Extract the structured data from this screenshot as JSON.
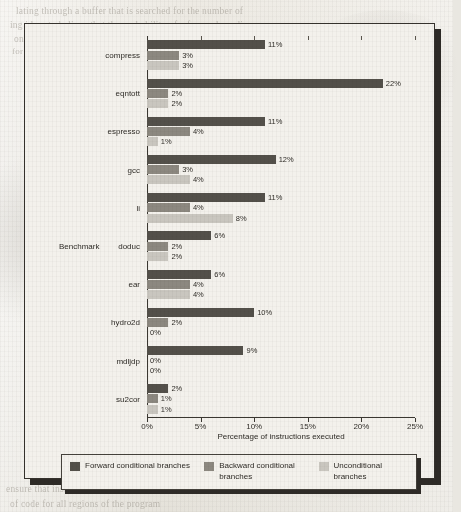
{
  "chart_data": {
    "type": "bar",
    "orientation": "horizontal",
    "title": "",
    "xlabel": "Percentage of instructions executed",
    "ylabel": "Benchmark",
    "xlim": [
      0,
      25
    ],
    "grid": false,
    "legend_position": "bottom",
    "xticks": [
      "0%",
      "5%",
      "10%",
      "15%",
      "20%",
      "25%"
    ],
    "categories": [
      "compress",
      "eqntott",
      "espresso",
      "gcc",
      "li",
      "doduc",
      "ear",
      "hydro2d",
      "mdljdp",
      "su2cor"
    ],
    "series": [
      {
        "name": "Forward conditional branches",
        "color": "#53504a",
        "values": [
          11,
          22,
          11,
          12,
          11,
          6,
          6,
          10,
          9,
          2
        ],
        "labels": [
          "11%",
          "22%",
          "11%",
          "12%",
          "11%",
          "6%",
          "6%",
          "10%",
          "9%",
          "2%"
        ]
      },
      {
        "name": "Backward conditional branches",
        "color": "#8c8880",
        "values": [
          3,
          2,
          4,
          3,
          4,
          2,
          4,
          2,
          0,
          1
        ],
        "labels": [
          "3%",
          "2%",
          "4%",
          "3%",
          "4%",
          "2%",
          "4%",
          "2%",
          "0%",
          "1%"
        ]
      },
      {
        "name": "Unconditional branches",
        "color": "#c9c6bf",
        "values": [
          3,
          2,
          1,
          4,
          8,
          2,
          4,
          0,
          0,
          1
        ],
        "labels": [
          "3%",
          "2%",
          "1%",
          "4%",
          "8%",
          "2%",
          "4%",
          "0%",
          "0%",
          "1%"
        ]
      }
    ]
  },
  "legend": {
    "items": [
      {
        "label": "Forward conditional branches",
        "swatch": "#53504a"
      },
      {
        "label": "Backward conditional branches",
        "swatch": "#8c8880"
      },
      {
        "label": "Unconditional branches",
        "swatch": "#c9c6bf"
      }
    ]
  },
  "page_bleed": {
    "line1": "lating through a buffer that is searched for the number of",
    "line2": "ing ideas to believe that the probability of a forward condi",
    "line3": "on the other hand, 4% of the branches are part of the loo",
    "line4": "for the average and only in some cases branches are taken",
    "line5": "ensure that instruction-dependent bits can best utilize the settings",
    "line6": "of code for all regions of the program",
    "side1": "instruction type",
    "side2": "conditional branch"
  }
}
